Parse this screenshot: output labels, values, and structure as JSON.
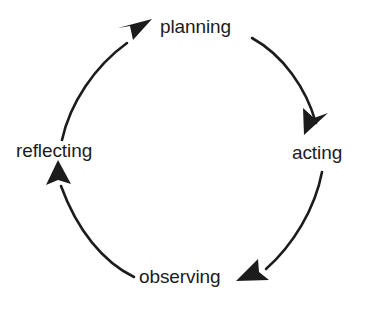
{
  "diagram": {
    "type": "cyclical-process-diagram",
    "background_color": "#ffffff",
    "stroke_color": "#1c1c1c",
    "text_color": "#1c1c1c",
    "direction": "clockwise",
    "nodes": [
      {
        "id": "planning",
        "label": "planning",
        "position": "top"
      },
      {
        "id": "acting",
        "label": "acting",
        "position": "right"
      },
      {
        "id": "observing",
        "label": "observing",
        "position": "bottom"
      },
      {
        "id": "reflecting",
        "label": "reflecting",
        "position": "left"
      }
    ],
    "arrows": [
      {
        "id": "planning-to-acting",
        "from": "planning",
        "to": "acting",
        "shape": "arc",
        "head": "down-left"
      },
      {
        "id": "acting-to-observing",
        "from": "acting",
        "to": "observing",
        "shape": "arc",
        "head": "left"
      },
      {
        "id": "observing-to-reflecting",
        "from": "observing",
        "to": "reflecting",
        "shape": "arc",
        "head": "up"
      },
      {
        "id": "reflecting-to-planning",
        "from": "reflecting",
        "to": "planning",
        "shape": "arc",
        "head": "up-right"
      }
    ]
  }
}
